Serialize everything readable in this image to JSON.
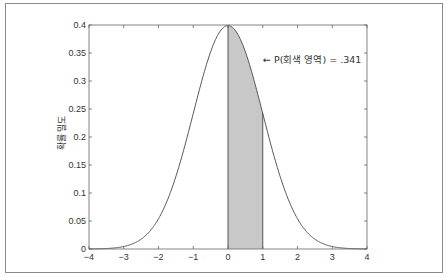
{
  "chart_data": {
    "type": "area",
    "title": "",
    "xlabel": "",
    "ylabel": "확률 밀도",
    "xlim": [
      -4,
      4
    ],
    "ylim": [
      0,
      0.4
    ],
    "grid": false,
    "legend": null,
    "x_ticks": [
      "−4",
      "−3",
      "−2",
      "−1",
      "0",
      "1",
      "2",
      "3",
      "4"
    ],
    "y_ticks": [
      "0",
      "0.05",
      "0.1",
      "0.15",
      "0.2",
      "0.25",
      "0.3",
      "0.35",
      "0.4"
    ],
    "series": [
      {
        "name": "Standard normal density",
        "function": "N(0,1) pdf",
        "x": [
          -4,
          -3.5,
          -3,
          -2.5,
          -2,
          -1.5,
          -1,
          -0.5,
          0,
          0.5,
          1,
          1.5,
          2,
          2.5,
          3,
          3.5,
          4
        ],
        "y": [
          0.0001,
          0.0009,
          0.0044,
          0.0175,
          0.054,
          0.1295,
          0.242,
          0.3521,
          0.3989,
          0.3521,
          0.242,
          0.1295,
          0.054,
          0.0175,
          0.0044,
          0.0009,
          0.0001
        ]
      }
    ],
    "shaded_region": {
      "from": 0,
      "to": 1,
      "color": "#c8c8c8",
      "probability": 0.341
    },
    "annotations": [
      {
        "text": "← P(회색 영역) = .341",
        "x": 1.35,
        "y": 0.35
      }
    ]
  },
  "colors": {
    "curve": "#555555",
    "shade": "#c8c8c8",
    "axis": "#666666",
    "frame": "#8a8a8a"
  }
}
